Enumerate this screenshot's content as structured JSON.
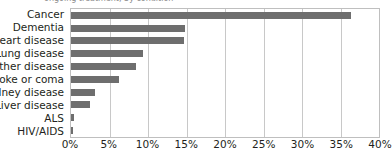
{
  "top_crop": {
    "text": "ongoing treatment, by condition"
  },
  "chart_data": {
    "type": "bar",
    "orientation": "horizontal",
    "title": "",
    "subtitle": "",
    "xlabel": "",
    "ylabel": "",
    "categories": [
      "Cancer",
      "Dementia",
      "Heart disease",
      "Lung disease",
      "Other disease",
      "Stroke or coma",
      "Kidney disease",
      "Liver disease",
      "ALS",
      "HIV/AIDS"
    ],
    "values": [
      36.4,
      14.8,
      14.7,
      9.3,
      8.4,
      6.2,
      3.1,
      2.5,
      0.4,
      0.3
    ],
    "value_suffix": "%",
    "xlim": [
      0,
      40
    ],
    "xticks": [
      0,
      5,
      10,
      15,
      20,
      25,
      30,
      35,
      40
    ],
    "xtick_labels": [
      "0%",
      "5%",
      "10%",
      "15%",
      "20%",
      "25%",
      "30%",
      "35%",
      "40%"
    ],
    "grid": true,
    "grid_axis": "x",
    "legend": false,
    "bar_color": "#6e6e6e",
    "grid_color": "#c8c8c8",
    "plot_border_color": "#bfbfbf",
    "background_color": "#ffffff",
    "text_color": "#231f20"
  }
}
